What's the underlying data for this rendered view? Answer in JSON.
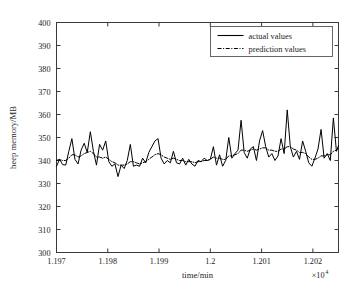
{
  "chart_data": {
    "type": "line",
    "title": "",
    "xlabel": "time/min",
    "ylabel": "heep memory/MB",
    "x_multiplier": "×10",
    "x_multiplier_exp": "4",
    "xlim": [
      11970,
      12025
    ],
    "ylim": [
      300,
      400
    ],
    "grid": false,
    "legend_position": "top-right",
    "x_ticks": [
      "1.197",
      "1.198",
      "1.199",
      "1.2",
      "1.201",
      "1.202"
    ],
    "x_tick_values": [
      11970,
      11980,
      11990,
      12000,
      12010,
      12020
    ],
    "y_ticks": [
      "300",
      "310",
      "320",
      "330",
      "340",
      "350",
      "360",
      "370",
      "380",
      "390",
      "400"
    ],
    "y_tick_values": [
      300,
      310,
      320,
      330,
      340,
      350,
      360,
      370,
      380,
      390,
      400
    ],
    "x": [
      11970,
      11970.6,
      11971.2,
      11971.8,
      11972.4,
      11973,
      11973.6,
      11974.2,
      11974.8,
      11975.4,
      11976,
      11976.6,
      11977.2,
      11977.8,
      11978.4,
      11979,
      11979.6,
      11980.2,
      11980.8,
      11981.4,
      11982,
      11982.6,
      11983.2,
      11983.8,
      11984.4,
      11985,
      11985.6,
      11986.2,
      11986.8,
      11987.4,
      11988,
      11988.6,
      11989.2,
      11989.8,
      11990.4,
      11991,
      11991.6,
      11992.2,
      11992.8,
      11993.4,
      11994,
      11994.6,
      11995.2,
      11995.8,
      11996.4,
      11997,
      11997.6,
      11998.2,
      11998.8,
      11999.4,
      12000,
      12000.6,
      12001.2,
      12001.8,
      12002.4,
      12003,
      12003.6,
      12004.2,
      12004.8,
      12005.4,
      12006,
      12006.6,
      12007.2,
      12007.8,
      12008.4,
      12009,
      12009.6,
      12010.2,
      12010.8,
      12011.4,
      12012,
      12012.6,
      12013.2,
      12013.8,
      12014.4,
      12015,
      12015.6,
      12016.2,
      12016.8,
      12017.4,
      12018,
      12018.6,
      12019.2,
      12019.8,
      12020.4,
      12021,
      12021.6,
      12022.2,
      12022.8,
      12023.4,
      12024,
      12024.6,
      12025
    ],
    "series": [
      {
        "name": "actual values",
        "style": "solid",
        "color": "#000000",
        "values": [
          337.5,
          340.5,
          338.2,
          338.0,
          344.0,
          349.5,
          340.5,
          338.5,
          344.5,
          347.5,
          343.5,
          352.5,
          344.0,
          338.0,
          347.0,
          344.5,
          348.5,
          339.5,
          337.5,
          338.5,
          333.0,
          338.0,
          336.5,
          340.0,
          347.0,
          337.5,
          338.0,
          337.5,
          341.0,
          339.0,
          343.5,
          346.0,
          348.5,
          349.5,
          341.0,
          338.5,
          340.0,
          339.0,
          344.0,
          339.0,
          338.5,
          341.0,
          338.0,
          340.5,
          338.5,
          337.5,
          340.0,
          339.5,
          341.0,
          340.0,
          340.5,
          346.0,
          338.0,
          342.5,
          337.5,
          340.0,
          350.0,
          341.0,
          343.0,
          344.5,
          357.5,
          343.5,
          341.0,
          345.0,
          346.0,
          340.0,
          348.5,
          353.0,
          346.0,
          341.5,
          343.0,
          340.0,
          342.0,
          349.5,
          343.0,
          362.0,
          346.0,
          341.5,
          344.0,
          340.5,
          348.5,
          344.0,
          339.0,
          337.5,
          341.0,
          345.0,
          353.5,
          341.0,
          343.0,
          340.0,
          358.5,
          344.0,
          346.5
        ]
      },
      {
        "name": "prediction values",
        "style": "dash-dot",
        "color": "#000000",
        "values": [
          340.0,
          340.5,
          340.0,
          340.0,
          341.0,
          342.5,
          342.5,
          341.5,
          342.0,
          343.0,
          343.5,
          344.0,
          343.0,
          341.5,
          341.5,
          341.0,
          341.5,
          340.5,
          339.5,
          339.0,
          338.0,
          338.0,
          338.0,
          338.5,
          339.5,
          339.5,
          339.0,
          338.5,
          339.0,
          339.5,
          340.5,
          341.5,
          342.5,
          343.0,
          342.5,
          341.5,
          341.0,
          340.5,
          341.0,
          340.5,
          340.0,
          340.0,
          339.5,
          339.5,
          339.5,
          339.0,
          339.5,
          339.5,
          340.0,
          340.0,
          340.5,
          341.5,
          341.0,
          341.0,
          340.5,
          340.5,
          342.0,
          342.0,
          342.5,
          343.0,
          344.5,
          344.5,
          344.0,
          344.5,
          345.0,
          344.5,
          345.0,
          345.5,
          345.5,
          344.5,
          344.5,
          344.0,
          344.0,
          345.0,
          345.0,
          346.0,
          346.0,
          345.0,
          344.5,
          343.5,
          343.5,
          343.0,
          341.5,
          340.5,
          340.5,
          341.0,
          342.0,
          342.0,
          342.5,
          342.5,
          344.0,
          344.5,
          345.5
        ]
      }
    ],
    "legend": [
      {
        "label": "actual values",
        "style": "solid"
      },
      {
        "label": "prediction values",
        "style": "dash-dot"
      }
    ]
  }
}
